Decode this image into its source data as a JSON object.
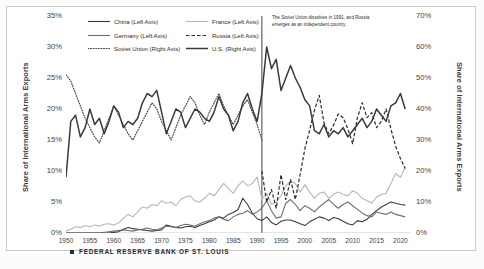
{
  "chart_data": {
    "type": "line",
    "title": "",
    "xlabel": "",
    "ylabel": "Share of International Arms Exports",
    "ylabel_right": "Share of International Arms Exports",
    "xlim": [
      1950,
      2022
    ],
    "ylim": [
      0,
      0.35
    ],
    "ylim_right": [
      0,
      0.7
    ],
    "grid": false,
    "legend_position": "top-center",
    "left_ticks": [
      "0%",
      "5%",
      "10%",
      "15%",
      "20%",
      "25%",
      "30%",
      "35%"
    ],
    "left_tick_values": [
      0,
      5,
      10,
      15,
      20,
      25,
      30,
      35
    ],
    "right_ticks": [
      "0%",
      "10%",
      "20%",
      "30%",
      "40%",
      "50%",
      "60%",
      "70%"
    ],
    "right_tick_values": [
      0,
      10,
      20,
      30,
      40,
      50,
      60,
      70
    ],
    "x_ticks": [
      "1950",
      "1955",
      "1960",
      "1965",
      "1970",
      "1975",
      "1980",
      "1985",
      "1990",
      "1995",
      "2000",
      "2005",
      "2010",
      "2015",
      "2020"
    ],
    "x_tick_values": [
      1950,
      1955,
      1960,
      1965,
      1970,
      1975,
      1980,
      1985,
      1990,
      1995,
      2000,
      2005,
      2010,
      2015,
      2020
    ],
    "annotation": "The Soviet Union dissolves in 1991, and Russia emerges as an independent country.",
    "annotation_x": 1991,
    "vline_x": 1991,
    "series": [
      {
        "name": "China (Left Axis)",
        "axis": "left",
        "style": "solid",
        "color": "#3b3b3b",
        "width": 1.1,
        "x": [
          1950,
          1951,
          1952,
          1953,
          1954,
          1955,
          1956,
          1957,
          1958,
          1959,
          1960,
          1961,
          1962,
          1963,
          1964,
          1965,
          1966,
          1967,
          1968,
          1969,
          1970,
          1971,
          1972,
          1973,
          1974,
          1975,
          1976,
          1977,
          1978,
          1979,
          1980,
          1981,
          1982,
          1983,
          1984,
          1985,
          1986,
          1987,
          1988,
          1989,
          1990,
          1991,
          1992,
          1993,
          1994,
          1995,
          1996,
          1997,
          1998,
          1999,
          2000,
          2001,
          2002,
          2003,
          2004,
          2005,
          2006,
          2007,
          2008,
          2009,
          2010,
          2011,
          2012,
          2013,
          2014,
          2015,
          2016,
          2017,
          2018,
          2019,
          2020,
          2021
        ],
        "values": [
          0,
          0,
          0,
          0,
          0,
          0,
          0,
          0,
          0,
          0,
          0.1,
          0.2,
          0.6,
          0.9,
          0.7,
          0.6,
          0.5,
          0.4,
          0.3,
          0.4,
          0.5,
          1.3,
          1.1,
          0.9,
          0.8,
          1.0,
          1.1,
          0.9,
          1.2,
          1.5,
          1.8,
          2.1,
          2.6,
          2.4,
          3.0,
          3.3,
          3.8,
          5.6,
          4.6,
          3.2,
          2.3,
          2.0,
          2.6,
          1.7,
          1.3,
          1.9,
          2.1,
          2.1,
          1.8,
          1.5,
          1.2,
          1.8,
          2.2,
          2.6,
          2.4,
          2.0,
          2.5,
          2.3,
          1.9,
          1.5,
          1.3,
          2.0,
          1.8,
          2.2,
          3.0,
          3.6,
          4.2,
          4.6,
          5.0,
          4.8,
          4.6,
          4.5
        ]
      },
      {
        "name": "France (Left Axis)",
        "axis": "left",
        "style": "solid",
        "color": "#b6b6b6",
        "width": 1.1,
        "x": [
          1950,
          1951,
          1952,
          1953,
          1954,
          1955,
          1956,
          1957,
          1958,
          1959,
          1960,
          1961,
          1962,
          1963,
          1964,
          1965,
          1966,
          1967,
          1968,
          1969,
          1970,
          1971,
          1972,
          1973,
          1974,
          1975,
          1976,
          1977,
          1978,
          1979,
          1980,
          1981,
          1982,
          1983,
          1984,
          1985,
          1986,
          1987,
          1988,
          1989,
          1990,
          1991,
          1992,
          1993,
          1994,
          1995,
          1996,
          1997,
          1998,
          1999,
          2000,
          2001,
          2002,
          2003,
          2004,
          2005,
          2006,
          2007,
          2008,
          2009,
          2010,
          2011,
          2012,
          2013,
          2014,
          2015,
          2016,
          2017,
          2018,
          2019,
          2020,
          2021
        ],
        "values": [
          0.3,
          0.6,
          1.0,
          0.9,
          1.2,
          1.0,
          1.3,
          1.1,
          1.4,
          1.5,
          1.3,
          1.6,
          2.4,
          3.0,
          2.6,
          3.4,
          4.2,
          4.0,
          4.6,
          4.4,
          5.2,
          4.8,
          5.0,
          4.4,
          5.4,
          5.8,
          6.0,
          5.2,
          5.0,
          5.6,
          6.4,
          6.0,
          7.0,
          8.0,
          7.2,
          6.4,
          7.6,
          8.4,
          7.6,
          8.0,
          9.0,
          5.4,
          6.4,
          4.6,
          5.0,
          6.0,
          7.6,
          8.4,
          8.0,
          6.6,
          7.8,
          6.6,
          5.6,
          6.4,
          6.6,
          5.6,
          6.2,
          6.6,
          6.2,
          6.0,
          6.8,
          6.4,
          5.6,
          5.2,
          4.8,
          5.8,
          6.2,
          6.4,
          8.0,
          9.6,
          9.0,
          10.6
        ]
      },
      {
        "name": "Germany (Left Axis)",
        "axis": "left",
        "style": "solid",
        "color": "#6e6e6e",
        "width": 1.1,
        "x": [
          1950,
          1951,
          1952,
          1953,
          1954,
          1955,
          1956,
          1957,
          1958,
          1959,
          1960,
          1961,
          1962,
          1963,
          1964,
          1965,
          1966,
          1967,
          1968,
          1969,
          1970,
          1971,
          1972,
          1973,
          1974,
          1975,
          1976,
          1977,
          1978,
          1979,
          1980,
          1981,
          1982,
          1983,
          1984,
          1985,
          1986,
          1987,
          1988,
          1989,
          1990,
          1991,
          1992,
          1993,
          1994,
          1995,
          1996,
          1997,
          1998,
          1999,
          2000,
          2001,
          2002,
          2003,
          2004,
          2005,
          2006,
          2007,
          2008,
          2009,
          2010,
          2011,
          2012,
          2013,
          2014,
          2015,
          2016,
          2017,
          2018,
          2019,
          2020,
          2021
        ],
        "values": [
          0,
          0,
          0,
          0,
          0,
          0,
          0,
          0,
          0.1,
          0.2,
          0.3,
          0.4,
          0.5,
          0.4,
          0.3,
          0.5,
          0.6,
          0.8,
          0.6,
          0.5,
          0.8,
          1.1,
          1.0,
          0.9,
          1.2,
          1.4,
          1.3,
          1.1,
          1.5,
          1.8,
          2.0,
          2.4,
          2.6,
          2.2,
          2.0,
          2.6,
          3.0,
          3.2,
          3.6,
          3.0,
          3.4,
          4.0,
          5.2,
          3.6,
          2.4,
          2.6,
          4.8,
          5.4,
          4.6,
          3.6,
          4.4,
          4.0,
          3.4,
          4.2,
          4.8,
          5.4,
          4.6,
          4.0,
          4.6,
          5.0,
          4.4,
          3.8,
          3.2,
          2.8,
          2.6,
          3.4,
          3.2,
          3.0,
          3.4,
          3.0,
          2.8,
          2.6
        ]
      },
      {
        "name": "Russia (Left Axis)",
        "axis": "left",
        "style": "dashed",
        "color": "#2b2b2b",
        "width": 1.2,
        "x": [
          1991,
          1992,
          1993,
          1994,
          1995,
          1996,
          1997,
          1998,
          1999,
          2000,
          2001,
          2002,
          2003,
          2004,
          2005,
          2006,
          2007,
          2008,
          2009,
          2010,
          2011,
          2012,
          2013,
          2014,
          2015,
          2016,
          2017,
          2018,
          2019,
          2020,
          2021
        ],
        "values": [
          10.0,
          5.0,
          7.0,
          4.0,
          9.4,
          5.4,
          8.6,
          5.4,
          9.4,
          13.6,
          16.6,
          19.8,
          22.2,
          17.8,
          16.0,
          17.4,
          19.2,
          18.6,
          16.8,
          14.4,
          18.6,
          21.0,
          18.6,
          19.4,
          17.0,
          18.0,
          20.0,
          16.8,
          14.0,
          12.0,
          10.4
        ]
      },
      {
        "name": "Soviet Union (Right Axis)",
        "axis": "right",
        "style": "dotted",
        "color": "#4a4a4a",
        "width": 1.2,
        "x": [
          1950,
          1951,
          1952,
          1953,
          1954,
          1955,
          1956,
          1957,
          1958,
          1959,
          1960,
          1961,
          1962,
          1963,
          1964,
          1965,
          1966,
          1967,
          1968,
          1969,
          1970,
          1971,
          1972,
          1973,
          1974,
          1975,
          1976,
          1977,
          1978,
          1979,
          1980,
          1981,
          1982,
          1983,
          1984,
          1985,
          1986,
          1987,
          1988,
          1989,
          1990,
          1991
        ],
        "values": [
          51,
          49,
          45,
          41,
          37,
          34,
          31,
          29,
          33,
          37,
          41,
          38,
          35,
          32,
          30,
          33,
          36,
          39,
          42,
          40,
          36,
          33,
          30,
          34,
          38,
          41,
          44,
          42,
          38,
          35,
          39,
          42,
          45,
          41,
          38,
          35,
          38,
          41,
          43,
          39,
          35,
          30
        ]
      },
      {
        "name": "U.S. (Right Axis)",
        "axis": "right",
        "style": "solid",
        "color": "#3a3a3a",
        "width": 1.5,
        "x": [
          1950,
          1951,
          1952,
          1953,
          1954,
          1955,
          1956,
          1957,
          1958,
          1959,
          1960,
          1961,
          1962,
          1963,
          1964,
          1965,
          1966,
          1967,
          1968,
          1969,
          1970,
          1971,
          1972,
          1973,
          1974,
          1975,
          1976,
          1977,
          1978,
          1979,
          1980,
          1981,
          1982,
          1983,
          1984,
          1985,
          1986,
          1987,
          1988,
          1989,
          1990,
          1991,
          1992,
          1993,
          1994,
          1995,
          1996,
          1997,
          1998,
          1999,
          2000,
          2001,
          2002,
          2003,
          2004,
          2005,
          2006,
          2007,
          2008,
          2009,
          2010,
          2011,
          2012,
          2013,
          2014,
          2015,
          2016,
          2017,
          2018,
          2019,
          2020,
          2021
        ],
        "values": [
          18,
          36,
          38,
          31,
          34,
          40,
          35,
          37,
          32,
          36,
          41,
          39,
          34,
          36,
          35,
          37,
          42,
          45,
          44,
          46,
          39,
          32,
          36,
          40,
          39,
          34,
          37,
          40,
          39,
          37,
          36,
          39,
          44,
          40,
          38,
          33,
          36,
          42,
          45,
          40,
          36,
          45,
          60,
          53,
          56,
          46,
          50,
          54,
          50,
          47,
          43,
          41,
          33,
          32,
          35,
          31,
          33,
          32,
          34,
          31,
          33,
          35,
          37,
          34,
          36,
          40,
          38,
          36,
          41,
          42,
          45,
          40
        ]
      }
    ]
  },
  "source": {
    "label": "FEDERAL RESERVE BANK OF ST. LOUIS",
    "marker": "square-marker"
  },
  "footnote": ""
}
